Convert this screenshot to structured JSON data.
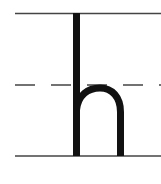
{
  "diagram": {
    "letter": "h",
    "guide_lines": [
      "top-solid",
      "middle-dashed",
      "baseline-solid"
    ],
    "colors": {
      "ink": "#111111",
      "line": "#444444",
      "background": "#ffffff"
    }
  }
}
